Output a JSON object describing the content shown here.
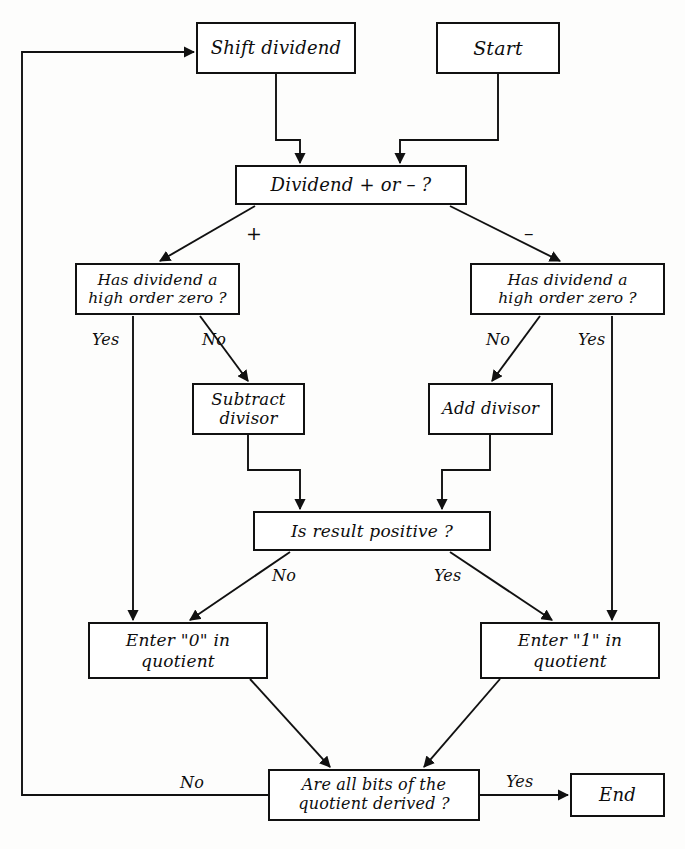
{
  "diagram": {
    "stroke_color": "#111111",
    "background_color": "#fdfdfc",
    "nodes": {
      "start": "Start",
      "shift_dividend": "Shift dividend",
      "dividend_sign": "Dividend + or – ?",
      "has_dividend_zero_left": "Has dividend a\nhigh order zero ?",
      "has_dividend_zero_right": "Has dividend a\nhigh order zero ?",
      "subtract_divisor": "Subtract\ndivisor",
      "add_divisor": "Add divisor",
      "is_result_positive": "Is result positive ?",
      "enter_zero": "Enter \"0\" in quotient",
      "enter_one": "Enter \"1\" in quotient",
      "all_bits_derived": "Are all bits of the\nquotient derived ?",
      "end": "End"
    },
    "edge_labels": {
      "sign_plus": "+",
      "sign_minus": "–",
      "left_zero_yes": "Yes",
      "left_zero_no": "No",
      "right_zero_no": "No",
      "right_zero_yes": "Yes",
      "result_no": "No",
      "result_yes": "Yes",
      "allbits_no": "No",
      "allbits_yes": "Yes"
    }
  }
}
